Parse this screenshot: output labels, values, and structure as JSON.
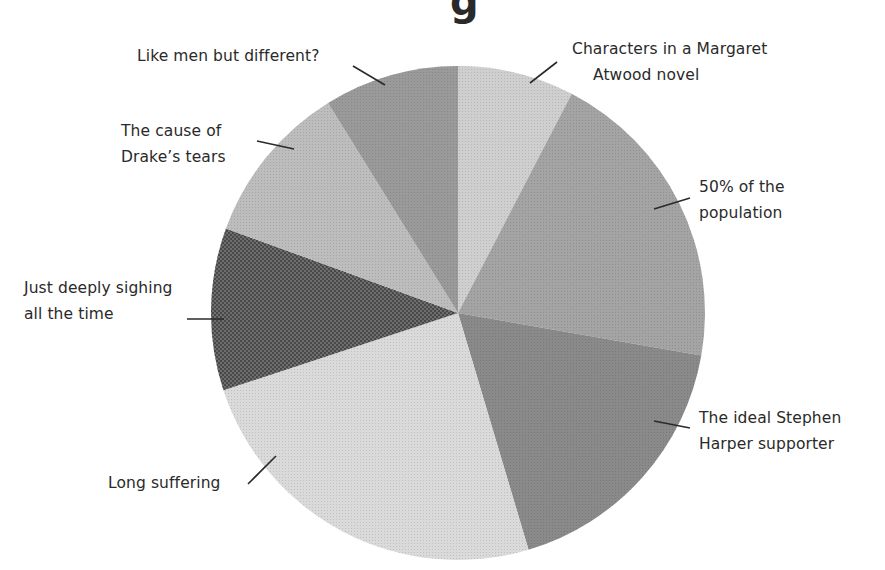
{
  "chart_data": {
    "type": "pie",
    "title": "",
    "title_visible_fragment": "g",
    "start_angle_deg": 0,
    "direction": "clockwise",
    "slices": [
      {
        "label": "Characters in a Margaret Atwood novel",
        "lines": [
          "Characters in a Margaret",
          "Atwood novel"
        ],
        "value": 7.6,
        "color": "#cfcfcf"
      },
      {
        "label": "50% of the population",
        "lines": [
          "50% of the",
          "population"
        ],
        "value": 20.1,
        "color": "#a4a4a4"
      },
      {
        "label": "The ideal Stephen Harper supporter",
        "lines": [
          "The ideal Stephen",
          "Harper supporter"
        ],
        "value": 17.6,
        "color": "#8a8a8a"
      },
      {
        "label": "Long suffering",
        "lines": [
          "Long suffering"
        ],
        "value": 24.5,
        "color": "#dadada"
      },
      {
        "label": "Just deeply sighing all the time",
        "lines": [
          "Just deeply sighing",
          "all the time"
        ],
        "value": 10.6,
        "color": "#6e6e6e"
      },
      {
        "label": "The cause of Drake's tears",
        "lines": [
          "The cause of",
          "Drake’s tears"
        ],
        "value": 10.6,
        "color": "#bdbdbd"
      },
      {
        "label": "Like men but different?",
        "lines": [
          "Like men but different?"
        ],
        "value": 8.8,
        "color": "#9a9a9a"
      }
    ],
    "legend": "none (callout labels with leader lines)"
  },
  "labels": {
    "atwood": {
      "l1": "Characters in a Margaret",
      "l2": "Atwood novel"
    },
    "population": {
      "l1": "50% of the",
      "l2": "population"
    },
    "harper": {
      "l1": "The ideal Stephen",
      "l2": "Harper supporter"
    },
    "suffering": {
      "l1": "Long suffering"
    },
    "sighing": {
      "l1": "Just deeply sighing",
      "l2": "all the time"
    },
    "drake": {
      "l1": "The cause of",
      "l2": "Drake’s tears"
    },
    "likemen": {
      "l1": "Like men but different?"
    }
  },
  "title_fragment": "g"
}
